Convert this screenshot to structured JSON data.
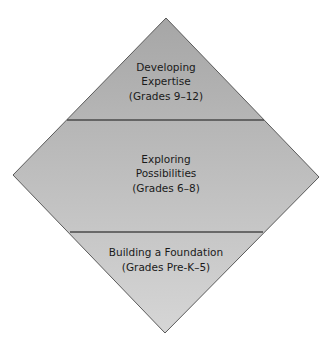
{
  "diagram": {
    "shape": "diamond",
    "levels": [
      {
        "id": "top",
        "lines": [
          "Developing",
          "Expertise",
          "(Grades 9–12)"
        ]
      },
      {
        "id": "middle",
        "lines": [
          "Exploring",
          "Possibilities",
          "(Grades 6–8)"
        ]
      },
      {
        "id": "bottom",
        "lines": [
          "Building a Foundation",
          "(Grades Pre-K–5)"
        ]
      }
    ],
    "colors": {
      "fill_top": "#a9a9a9",
      "fill_bottom": "#d2d2d2",
      "outline": "#5a5a5a",
      "divider": "#4a4a4a",
      "text": "#1a1a1a"
    }
  }
}
